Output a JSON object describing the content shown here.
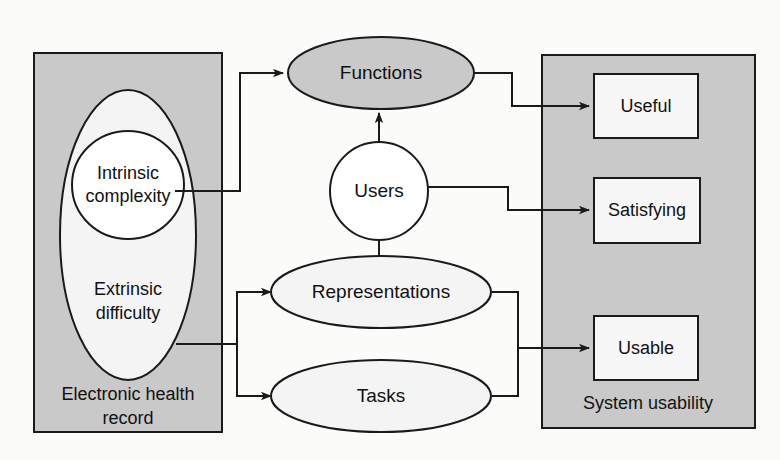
{
  "diagram": {
    "colors": {
      "panel_fill": "#c9c9c9",
      "panel_stroke": "#1a1a1a",
      "ellipse_gray_fill": "#c9c9c9",
      "ellipse_light_fill": "#f4f4f4",
      "circle_fill": "#ffffff",
      "box_fill": "#f7f7f7",
      "line_color": "#1a1a1a",
      "background": "#fbfbfa"
    },
    "left_panel": {
      "caption_line1": "Electronic health",
      "caption_line2": "record",
      "outer_ellipse_label_line1": "Extrinsic",
      "outer_ellipse_label_line2": "difficulty",
      "inner_ellipse_label_line1": "Intrinsic",
      "inner_ellipse_label_line2": "complexity"
    },
    "center_nodes": [
      {
        "id": "functions",
        "label": "Functions",
        "shape": "ellipse",
        "fill": "gray"
      },
      {
        "id": "users",
        "label": "Users",
        "shape": "circle",
        "fill": "white"
      },
      {
        "id": "representations",
        "label": "Representations",
        "shape": "ellipse",
        "fill": "light"
      },
      {
        "id": "tasks",
        "label": "Tasks",
        "shape": "ellipse",
        "fill": "light"
      }
    ],
    "right_panel": {
      "caption": "System usability",
      "outcomes": [
        {
          "id": "useful",
          "label": "Useful"
        },
        {
          "id": "satisfying",
          "label": "Satisfying"
        },
        {
          "id": "usable",
          "label": "Usable"
        }
      ]
    },
    "connections": [
      {
        "from": "intrinsic-complexity",
        "to": "functions",
        "arrow": true
      },
      {
        "from": "extrinsic-difficulty",
        "to": "representations",
        "arrow": true
      },
      {
        "from": "extrinsic-difficulty",
        "to": "tasks",
        "arrow": true
      },
      {
        "from": "users",
        "to": "functions",
        "arrow": true
      },
      {
        "from": "users",
        "to": "representations",
        "arrow": true
      },
      {
        "from": "functions",
        "to": "useful",
        "arrow": true
      },
      {
        "from": "users",
        "to": "satisfying",
        "arrow": true
      },
      {
        "from": "representations",
        "to": "usable",
        "arrow": true
      },
      {
        "from": "tasks",
        "to": "usable",
        "arrow": true
      }
    ]
  }
}
